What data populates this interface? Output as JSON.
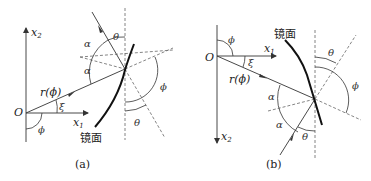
{
  "figure": {
    "panels": [
      {
        "id": "a",
        "caption": "(a)",
        "labels": {
          "x2_axis": "x",
          "x2_sub": "2",
          "x1_axis": "x",
          "x1_sub": "1",
          "origin": "O",
          "radius": "r(ϕ)",
          "xi": "ξ",
          "phi_origin": "ϕ",
          "alpha_top": "α",
          "alpha_bottom": "α",
          "theta_top": "θ",
          "theta_bottom": "θ",
          "phi_right": "ϕ",
          "mirror": "镜面"
        }
      },
      {
        "id": "b",
        "caption": "(b)",
        "labels": {
          "x2_axis": "x",
          "x2_sub": "2",
          "x1_axis": "x",
          "x1_sub": "1",
          "origin": "O",
          "radius": "r(ϕ)",
          "xi": "ξ",
          "phi_origin": "ϕ",
          "alpha_top": "α",
          "alpha_bottom": "α",
          "theta_top": "θ",
          "theta_bottom": "θ",
          "phi_right": "ϕ",
          "mirror": "镜面"
        }
      }
    ],
    "colors": {
      "line": "#333333",
      "mirror": "#111111",
      "dashed": "#666666"
    }
  }
}
